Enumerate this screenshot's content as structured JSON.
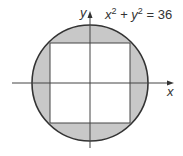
{
  "diagram": {
    "equation": {
      "lhs_x": "x",
      "exp": "2",
      "plus": " + ",
      "lhs_y": "y",
      "equals": " = 36"
    },
    "x_axis_label": "x",
    "y_axis_label": "y",
    "shape": "circle with inscribed square, region between shaded",
    "colors": {
      "shade": "#c8c8c8",
      "stroke": "#333333",
      "background": "#ffffff"
    }
  }
}
